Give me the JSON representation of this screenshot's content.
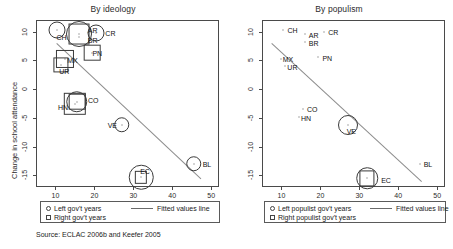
{
  "figure": {
    "source_note": "Source: ECLAC 2006b and Keefer 2005",
    "axis": {
      "xlabel": "School attendance, 1990",
      "ylabel": "Change in school attendance",
      "xticks": [
        "10",
        "20",
        "30",
        "40",
        "50"
      ],
      "yticks": [
        "10",
        "5",
        "0",
        "-5",
        "-10",
        "-15"
      ]
    }
  },
  "chart_data": [
    {
      "type": "scatter",
      "title": "By ideology",
      "xlabel": "School attendance, 1990",
      "ylabel": "Change in school attendance",
      "xlim": [
        5,
        52
      ],
      "ylim": [
        -17,
        12
      ],
      "xticks": [
        10,
        20,
        30,
        40,
        50
      ],
      "yticks": [
        10,
        5,
        0,
        -5,
        -10,
        -15
      ],
      "grid": false,
      "legend_position": "below-plot",
      "legend": [
        {
          "key": "circle",
          "label": "Left gov't years"
        },
        {
          "key": "square",
          "label": "Right gov't years"
        },
        {
          "key": "line",
          "label": "Fitted values line"
        }
      ],
      "fit_line": {
        "x0": 10.5,
        "y0": 8.0,
        "x1": 47.5,
        "y1": -15.5
      },
      "points": [
        {
          "code": "CH",
          "x": 10.5,
          "y": 10.3,
          "left_years": 6,
          "right_years": 0,
          "label_dx": -1,
          "label_dy": 7
        },
        {
          "code": "AR",
          "x": 16.0,
          "y": 9.6,
          "left_years": 12,
          "right_years": 9,
          "label_dx": 9,
          "label_dy": -4
        },
        {
          "code": "BR",
          "x": 16.0,
          "y": 9.0,
          "left_years": 0,
          "right_years": 0,
          "label_dx": 9,
          "label_dy": 3
        },
        {
          "code": "CR",
          "x": 20.5,
          "y": 9.7,
          "left_years": 6,
          "right_years": 0,
          "label_dx": 9,
          "label_dy": 0
        },
        {
          "code": "PN",
          "x": 19.5,
          "y": 6.3,
          "left_years": 0,
          "right_years": 6,
          "label_dx": 0,
          "label_dy": 0
        },
        {
          "code": "MX",
          "x": 12.5,
          "y": 5.2,
          "left_years": 0,
          "right_years": 7,
          "label_dx": 2,
          "label_dy": 1
        },
        {
          "code": "UR",
          "x": 11.5,
          "y": 4.2,
          "left_years": 0,
          "right_years": 5,
          "label_dx": -2,
          "label_dy": 6
        },
        {
          "code": "CO",
          "x": 15.5,
          "y": -2.2,
          "left_years": 9,
          "right_years": 6,
          "label_dx": 11,
          "label_dy": -2
        },
        {
          "code": "HN",
          "x": 15.0,
          "y": -2.6,
          "left_years": 0,
          "right_years": 10,
          "label_dx": -17,
          "label_dy": 3
        },
        {
          "code": "VE",
          "x": 27.0,
          "y": -6.2,
          "left_years": 5,
          "right_years": 0,
          "label_dx": -14,
          "label_dy": 0
        },
        {
          "code": "EC",
          "x": 32.0,
          "y": -15.3,
          "left_years": 11,
          "right_years": 3,
          "label_dx": -1,
          "label_dy": -6
        },
        {
          "code": "BL",
          "x": 45.5,
          "y": -13.0,
          "left_years": 5,
          "right_years": 0,
          "label_dx": 9,
          "label_dy": 0
        }
      ]
    },
    {
      "type": "scatter",
      "title": "By populism",
      "xlabel": "School attendance, 1990",
      "ylabel": "Change in school attendance",
      "xlim": [
        5,
        52
      ],
      "ylim": [
        -17,
        12
      ],
      "xticks": [
        10,
        20,
        30,
        40,
        50
      ],
      "yticks": [
        10,
        5,
        0,
        -5,
        -10,
        -15
      ],
      "grid": false,
      "legend_position": "below-plot",
      "legend": [
        {
          "key": "circle",
          "label": "Left populist gov't years"
        },
        {
          "key": "square",
          "label": "Right populist gov't years"
        },
        {
          "key": "line",
          "label": "Fitted values line"
        }
      ],
      "fit_line": {
        "x0": 7.5,
        "y0": 8.0,
        "x1": 46.0,
        "y1": -16.0
      },
      "points": [
        {
          "code": "CH",
          "x": 10.5,
          "y": 10.3,
          "left_years": 0,
          "right_years": 0,
          "label_dx": 4,
          "label_dy": 0
        },
        {
          "code": "AR",
          "x": 16.0,
          "y": 9.6,
          "left_years": 0,
          "right_years": 0,
          "label_dx": 4,
          "label_dy": 1
        },
        {
          "code": "BR",
          "x": 16.0,
          "y": 8.2,
          "left_years": 0,
          "right_years": 0,
          "label_dx": 4,
          "label_dy": 1
        },
        {
          "code": "CR",
          "x": 21.0,
          "y": 9.9,
          "left_years": 0,
          "right_years": 0,
          "label_dx": 4,
          "label_dy": 0
        },
        {
          "code": "PN",
          "x": 19.5,
          "y": 5.6,
          "left_years": 0,
          "right_years": 0,
          "label_dx": 4,
          "label_dy": 1
        },
        {
          "code": "MX",
          "x": 9.8,
          "y": 5.2,
          "left_years": 0,
          "right_years": 0,
          "label_dx": 2,
          "label_dy": 0
        },
        {
          "code": "UR",
          "x": 11.0,
          "y": 4.0,
          "left_years": 0,
          "right_years": 0,
          "label_dx": 2,
          "label_dy": 1
        },
        {
          "code": "CO",
          "x": 15.5,
          "y": -3.5,
          "left_years": 0,
          "right_years": 0,
          "label_dx": 4,
          "label_dy": 0
        },
        {
          "code": "HN",
          "x": 14.5,
          "y": -4.8,
          "left_years": 0,
          "right_years": 0,
          "label_dx": 2,
          "label_dy": 1
        },
        {
          "code": "VE",
          "x": 27.0,
          "y": -6.2,
          "left_years": 8,
          "right_years": 0,
          "label_dx": -1,
          "label_dy": 6
        },
        {
          "code": "EC",
          "x": 32.0,
          "y": -15.5,
          "left_years": 9,
          "right_years": 5,
          "label_dx": 14,
          "label_dy": 2
        },
        {
          "code": "BL",
          "x": 45.5,
          "y": -13.0,
          "left_years": 0,
          "right_years": 0,
          "label_dx": 4,
          "label_dy": 0
        }
      ]
    }
  ]
}
